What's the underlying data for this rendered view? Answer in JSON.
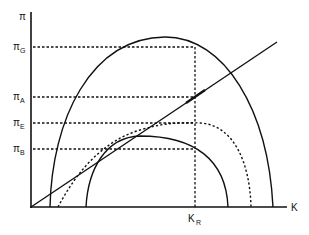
{
  "diagram": {
    "y_axis": {
      "label": "π"
    },
    "x_axis": {
      "label": "K"
    },
    "y_levels": [
      {
        "id": "G",
        "symbol": "π",
        "subscript": "G",
        "y": 47
      },
      {
        "id": "A",
        "symbol": "π",
        "subscript": "A",
        "y": 97
      },
      {
        "id": "E",
        "symbol": "π",
        "subscript": "E",
        "y": 123
      },
      {
        "id": "B",
        "symbol": "π",
        "subscript": "B",
        "y": 149
      }
    ],
    "x_marker": {
      "symbol": "K",
      "subscript": "R",
      "x": 195
    },
    "curves": [
      {
        "name": "large-arch",
        "style": "solid"
      },
      {
        "name": "small-arch",
        "style": "solid"
      },
      {
        "name": "intermediate-arch",
        "style": "dotted"
      },
      {
        "name": "ray-from-origin",
        "style": "solid"
      }
    ],
    "colors": {
      "line": "#111111",
      "background": "#ffffff"
    }
  }
}
